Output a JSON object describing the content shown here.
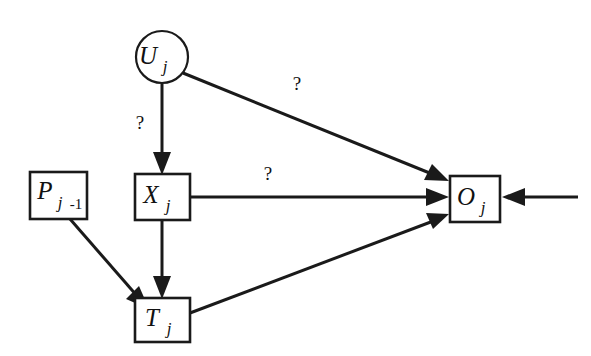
{
  "diagram": {
    "background_color": "#ffffff",
    "stroke_color": "#1a1a1a",
    "nodes": [
      {
        "id": "U",
        "shape": "circle",
        "symbol": "U",
        "subscript": "j",
        "subscript_extra": "",
        "cx": 162,
        "cy": 57,
        "r": 26
      },
      {
        "id": "P",
        "shape": "rect",
        "symbol": "P",
        "subscript": "j",
        "subscript_extra": "-1",
        "x": 30,
        "y": 172,
        "w": 57,
        "h": 47
      },
      {
        "id": "X",
        "shape": "rect",
        "symbol": "X",
        "subscript": "j",
        "subscript_extra": "",
        "x": 135,
        "y": 174,
        "w": 55,
        "h": 46
      },
      {
        "id": "T",
        "shape": "rect",
        "symbol": "T",
        "subscript": "j",
        "subscript_extra": "",
        "x": 135,
        "y": 298,
        "w": 55,
        "h": 44
      },
      {
        "id": "O",
        "shape": "rect",
        "symbol": "O",
        "subscript": "j",
        "subscript_extra": "",
        "x": 450,
        "y": 176,
        "w": 50,
        "h": 46
      }
    ],
    "edges": [
      {
        "id": "U-to-X",
        "from": "U",
        "to": "X",
        "label": "?",
        "label_x": 140,
        "label_y": 129
      },
      {
        "id": "U-to-O",
        "from": "U",
        "to": "O",
        "label": "?",
        "label_x": 297,
        "label_y": 90
      },
      {
        "id": "X-to-O",
        "from": "X",
        "to": "O",
        "label": "?",
        "label_x": 268,
        "label_y": 180
      },
      {
        "id": "X-to-T",
        "from": "X",
        "to": "T",
        "label": "",
        "label_x": 0,
        "label_y": 0
      },
      {
        "id": "P-to-T",
        "from": "P",
        "to": "T",
        "label": "",
        "label_x": 0,
        "label_y": 0
      },
      {
        "id": "T-to-O",
        "from": "T",
        "to": "O",
        "label": "",
        "label_x": 0,
        "label_y": 0
      },
      {
        "id": "external-to-O",
        "from": "external",
        "to": "O",
        "label": "",
        "label_x": 0,
        "label_y": 0
      }
    ]
  }
}
